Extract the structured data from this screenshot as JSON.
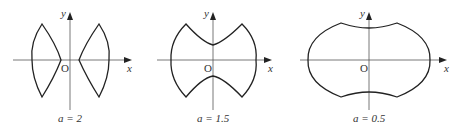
{
  "panels": [
    {
      "caption": "a = 2",
      "param_name": "a",
      "param_value": "2",
      "x_label": "x",
      "y_label": "y",
      "origin_label": "O"
    },
    {
      "caption": "a = 1.5",
      "param_name": "a",
      "param_value": "1.5",
      "x_label": "x",
      "y_label": "y",
      "origin_label": "O"
    },
    {
      "caption": "a = 0.5",
      "param_name": "a",
      "param_value": "0.5",
      "x_label": "x",
      "y_label": "y",
      "origin_label": "O"
    }
  ],
  "colors": {
    "curve": "#222222",
    "axis": "#555555",
    "background": "#ffffff"
  }
}
